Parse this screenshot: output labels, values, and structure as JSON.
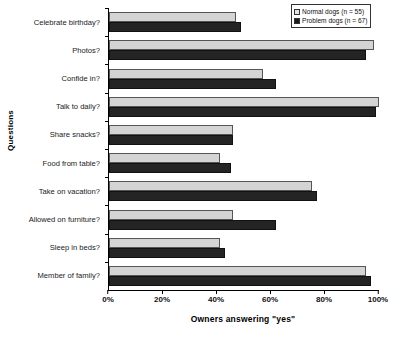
{
  "chart_data": {
    "type": "bar",
    "orientation": "horizontal",
    "title": "",
    "xlabel": "Owners answering \"yes\"",
    "ylabel": "Questions",
    "xlim": [
      0,
      100
    ],
    "xticks": [
      0,
      20,
      40,
      60,
      80,
      100
    ],
    "xtick_labels": [
      "0%",
      "20%",
      "40%",
      "60%",
      "80%",
      "100%"
    ],
    "grid": false,
    "legend_position": "top-right",
    "categories": [
      "Celebrate birthday?",
      "Photos?",
      "Confide in?",
      "Talk to daily?",
      "Share snacks?",
      "Food from table?",
      "Take on vacation?",
      "Allowed on furniture?",
      "Sleep in beds?",
      "Member of family?"
    ],
    "series": [
      {
        "name": "Normal dogs (n = 55)",
        "color": "#d4d4d4",
        "values": [
          47,
          98,
          57,
          100,
          46,
          41,
          75,
          46,
          41,
          95
        ]
      },
      {
        "name": "Problem dogs (n = 67)",
        "color": "#242424",
        "values": [
          49,
          95,
          62,
          99,
          46,
          45,
          77,
          62,
          43,
          97
        ]
      }
    ]
  },
  "legend": {
    "entries": [
      {
        "label": "Normal dogs (n = 55)",
        "swatch": "normal"
      },
      {
        "label": "Problem dogs (n = 67)",
        "swatch": "problem"
      }
    ]
  }
}
